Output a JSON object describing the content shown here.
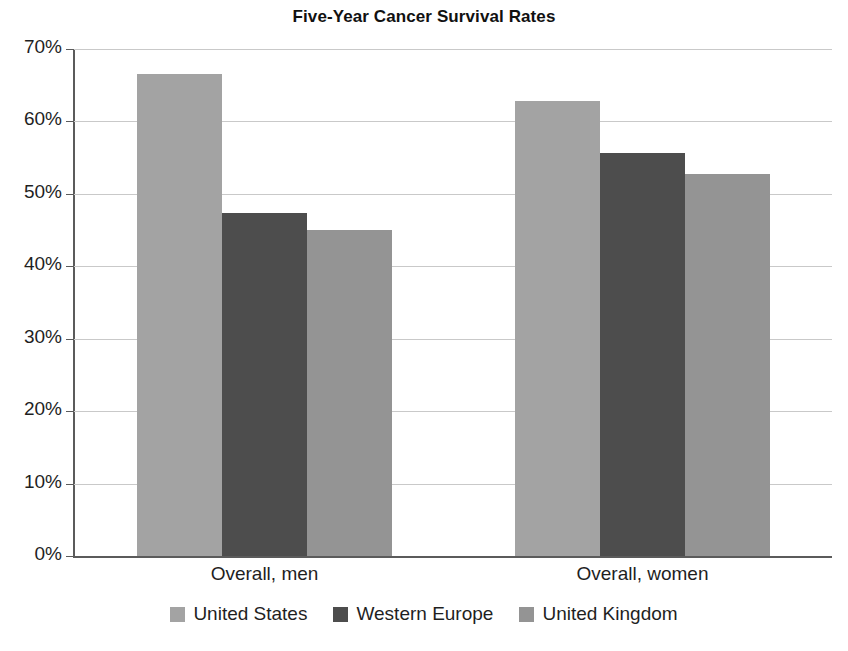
{
  "chart_data": {
    "type": "bar",
    "title": "Five-Year Cancer Survival Rates",
    "xlabel": "",
    "ylabel": "",
    "categories": [
      "Overall, men",
      "Overall, women"
    ],
    "series": [
      {
        "name": "United States",
        "color": "#a3a3a3",
        "values": [
          66.6,
          62.8
        ]
      },
      {
        "name": "Western Europe",
        "color": "#4d4d4d",
        "values": [
          47.4,
          55.6
        ]
      },
      {
        "name": "United Kingdom",
        "color": "#949494",
        "values": [
          45.0,
          52.8
        ]
      }
    ],
    "ylim": [
      0,
      70
    ],
    "ytick_step": 10,
    "ytick_labels": [
      "0%",
      "10%",
      "20%",
      "30%",
      "40%",
      "50%",
      "60%",
      "70%"
    ],
    "ytick_values": [
      0,
      10,
      20,
      30,
      40,
      50,
      60,
      70
    ],
    "grid": true,
    "grid_axis": "y",
    "legend_position": "bottom",
    "value_suffix": "%"
  },
  "colors": {
    "gridline": "#c9c9c9",
    "axis": "#5b5b5b",
    "text": "#1f1f1f",
    "background": "#ffffff"
  }
}
